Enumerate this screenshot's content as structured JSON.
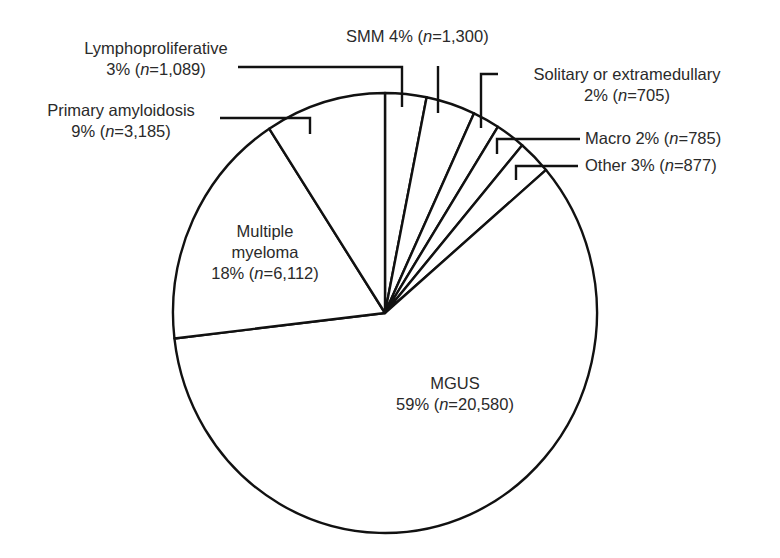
{
  "chart_data": {
    "type": "pie",
    "title": "",
    "start_angle_deg": 0,
    "direction": "clockwise",
    "stroke_color": "#111111",
    "fill_color": "#ffffff",
    "slices": [
      {
        "name": "Lymphoproliferative",
        "percent": 3,
        "n": 1089,
        "n_label": "1,089"
      },
      {
        "name": "SMM",
        "percent": 4,
        "n": 1300,
        "n_label": "1,300"
      },
      {
        "name": "Solitary or extramedullary",
        "percent": 2,
        "n": 705,
        "n_label": "705"
      },
      {
        "name": "Macro",
        "percent": 2,
        "n": 785,
        "n_label": "785"
      },
      {
        "name": "Other",
        "percent": 3,
        "n": 877,
        "n_label": "877"
      },
      {
        "name": "MGUS",
        "percent": 59,
        "n": 20580,
        "n_label": "20,580"
      },
      {
        "name": "Multiple myeloma",
        "percent": 18,
        "n": 6112,
        "n_label": "6,112"
      },
      {
        "name": "Primary amyloidosis",
        "percent": 9,
        "n": 3185,
        "n_label": "3,185"
      }
    ]
  },
  "labels": {
    "lympho": {
      "line1": "Lymphoproliferative",
      "pct": "3% (",
      "n": "n",
      "rest": "=1,089)"
    },
    "amyloid": {
      "line1": "Primary amyloidosis",
      "pct": "9% (",
      "n": "n",
      "rest": "=3,185)"
    },
    "smm": {
      "pct": "SMM 4% (",
      "n": "n",
      "rest": "=1,300)"
    },
    "solitary": {
      "line1": "Solitary or extramedullary",
      "pct": "2% (",
      "n": "n",
      "rest": "=705)"
    },
    "macro": {
      "pct": "Macro 2% (",
      "n": "n",
      "rest": "=785)"
    },
    "other": {
      "pct": "Other 3% (",
      "n": "n",
      "rest": "=877)"
    },
    "mm": {
      "line1": "Multiple",
      "line2": "myeloma",
      "pct": "18% (",
      "n": "n",
      "rest": "=6,112)"
    },
    "mgus": {
      "line1": "MGUS",
      "pct": "59% (",
      "n": "n",
      "rest": "=20,580)"
    }
  }
}
